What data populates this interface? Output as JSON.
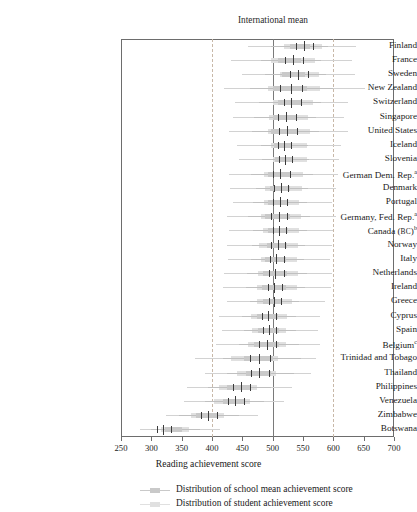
{
  "chart_data": {
    "type": "bar",
    "title": "International mean",
    "xlabel": "Reading achievement score",
    "ylabel": "",
    "xlim": [
      250,
      700
    ],
    "xticks": [
      250,
      300,
      350,
      400,
      450,
      500,
      550,
      600,
      650,
      700
    ],
    "xticklabels": [
      "250",
      "300",
      "350",
      "400",
      "450",
      "500",
      "550",
      "600",
      "650",
      "700"
    ],
    "grid": false,
    "reference_lines": [
      {
        "value": 400,
        "style": "dashed",
        "label": ""
      },
      {
        "value": 500,
        "style": "solid",
        "label": "International mean"
      },
      {
        "value": 600,
        "style": "dashed",
        "label": ""
      }
    ],
    "legend_position": "bottom",
    "legend": [
      {
        "name": "Distribution of school mean achievement score",
        "color": "#c9c9c9"
      },
      {
        "name": "Distribution of student achievement score",
        "color": "#e0e0e0"
      }
    ],
    "categories": [
      "Finland",
      "France",
      "Sweden",
      "New Zealand",
      "Switzerland",
      "Singapore",
      "United States",
      "Iceland",
      "Slovenia",
      "German Dem. Rep.",
      "Denmark",
      "Portugal",
      "Germany, Fed. Rep.",
      "Canada (BC)",
      "Norway",
      "Italy",
      "Netherlands",
      "Ireland",
      "Greece",
      "Cyprus",
      "Spain",
      "Belgium",
      "Trinidad and Tobago",
      "Thailand",
      "Philippines",
      "Venezuela",
      "Zimbabwe",
      "Botswana"
    ],
    "category_footnotes": {
      "German Dem. Rep.": "a",
      "Germany, Fed. Rep.": "a",
      "Canada (BC)": "b",
      "Belgium": "c"
    },
    "series": [
      {
        "name": "Distribution of student achievement score",
        "stat": "whisker_min, box_low, box_high, whisker_max",
        "values": [
          [
            460,
            518,
            582,
            638
          ],
          [
            432,
            498,
            570,
            630
          ],
          [
            450,
            512,
            576,
            636
          ],
          [
            420,
            492,
            578,
            652
          ],
          [
            438,
            500,
            566,
            624
          ],
          [
            434,
            494,
            558,
            618
          ],
          [
            428,
            492,
            562,
            624
          ],
          [
            442,
            498,
            556,
            612
          ],
          [
            444,
            500,
            556,
            610
          ],
          [
            428,
            486,
            550,
            608
          ],
          [
            430,
            488,
            548,
            604
          ],
          [
            434,
            486,
            544,
            598
          ],
          [
            424,
            480,
            546,
            604
          ],
          [
            428,
            484,
            544,
            600
          ],
          [
            424,
            478,
            542,
            598
          ],
          [
            426,
            480,
            540,
            594
          ],
          [
            420,
            476,
            542,
            598
          ],
          [
            418,
            474,
            540,
            596
          ],
          [
            424,
            474,
            532,
            586
          ],
          [
            412,
            464,
            524,
            578
          ],
          [
            416,
            466,
            522,
            574
          ],
          [
            406,
            460,
            522,
            578
          ],
          [
            372,
            432,
            508,
            572
          ],
          [
            388,
            442,
            506,
            564
          ],
          [
            358,
            412,
            474,
            532
          ],
          [
            354,
            404,
            462,
            518
          ],
          [
            324,
            366,
            420,
            476
          ],
          [
            282,
            316,
            362,
            414
          ]
        ]
      },
      {
        "name": "Distribution of school mean achievement score",
        "stat": "whisker_min, box_low, box_high, whisker_max",
        "values": [
          [
            498,
            528,
            562,
            592
          ],
          [
            480,
            508,
            546,
            580
          ],
          [
            488,
            516,
            554,
            588
          ],
          [
            462,
            500,
            556,
            600
          ],
          [
            478,
            508,
            546,
            580
          ],
          [
            470,
            500,
            538,
            572
          ],
          [
            466,
            498,
            540,
            576
          ],
          [
            480,
            502,
            532,
            558
          ],
          [
            482,
            504,
            534,
            560
          ],
          [
            464,
            492,
            530,
            566
          ],
          [
            472,
            496,
            528,
            558
          ],
          [
            468,
            492,
            526,
            556
          ],
          [
            460,
            488,
            528,
            562
          ],
          [
            468,
            492,
            526,
            556
          ],
          [
            466,
            490,
            524,
            554
          ],
          [
            464,
            488,
            522,
            552
          ],
          [
            458,
            484,
            524,
            556
          ],
          [
            456,
            482,
            522,
            554
          ],
          [
            462,
            484,
            516,
            544
          ],
          [
            450,
            474,
            508,
            538
          ],
          [
            452,
            476,
            510,
            538
          ],
          [
            444,
            470,
            510,
            544
          ],
          [
            418,
            452,
            500,
            546
          ],
          [
            424,
            456,
            498,
            536
          ],
          [
            394,
            424,
            462,
            498
          ],
          [
            388,
            418,
            454,
            486
          ],
          [
            346,
            374,
            410,
            444
          ],
          [
            300,
            322,
            350,
            380
          ]
        ]
      },
      {
        "name": "Quartile markers",
        "stat": "q1, median, q3",
        "values": [
          [
            538,
            552,
            566
          ],
          [
            520,
            534,
            550
          ],
          [
            528,
            542,
            558
          ],
          [
            512,
            530,
            548
          ],
          [
            518,
            530,
            546
          ],
          [
            508,
            522,
            538
          ],
          [
            510,
            524,
            540
          ],
          [
            508,
            518,
            530
          ],
          [
            510,
            520,
            532
          ],
          [
            500,
            512,
            528
          ],
          [
            502,
            514,
            526
          ],
          [
            500,
            512,
            524
          ],
          [
            498,
            510,
            524
          ],
          [
            500,
            510,
            522
          ],
          [
            498,
            508,
            520
          ],
          [
            496,
            506,
            518
          ],
          [
            494,
            504,
            518
          ],
          [
            492,
            502,
            516
          ],
          [
            494,
            502,
            514
          ],
          [
            482,
            492,
            506
          ],
          [
            484,
            494,
            506
          ],
          [
            478,
            490,
            506
          ],
          [
            462,
            478,
            496
          ],
          [
            464,
            478,
            494
          ],
          [
            434,
            448,
            462
          ],
          [
            426,
            438,
            452
          ],
          [
            382,
            394,
            408
          ],
          [
            310,
            320,
            332
          ]
        ]
      }
    ]
  }
}
